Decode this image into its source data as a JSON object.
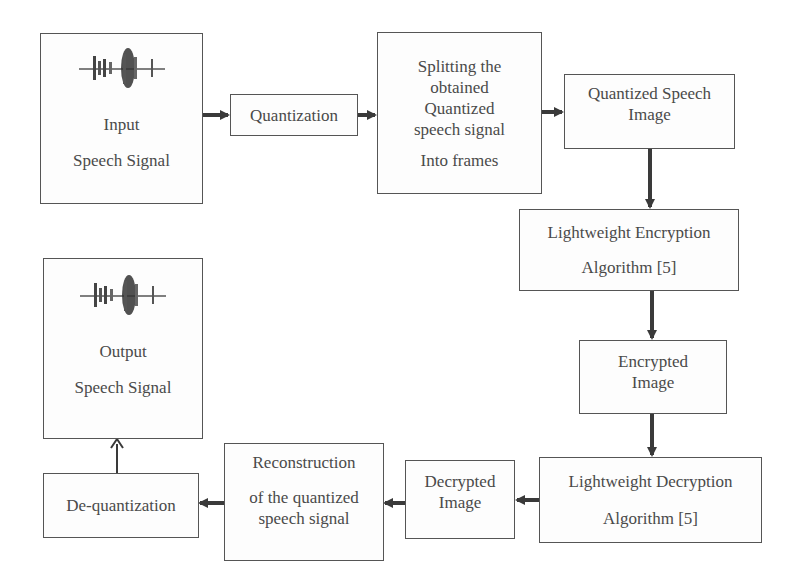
{
  "diagram": {
    "nodes": {
      "input": {
        "lines": [
          "Input",
          "Speech Signal"
        ],
        "icon": "speech-waveform-icon"
      },
      "quantization": {
        "lines": [
          "Quantization"
        ]
      },
      "splitting": {
        "lines": [
          "Splitting the",
          "obtained",
          "Quantized",
          "speech signal",
          "Into frames"
        ]
      },
      "quantized_image": {
        "lines": [
          "Quantized Speech",
          "Image"
        ]
      },
      "encryption": {
        "lines": [
          "Lightweight Encryption",
          "Algorithm [5]"
        ]
      },
      "encrypted_image": {
        "lines": [
          "Encrypted",
          "Image"
        ]
      },
      "decryption": {
        "lines": [
          "Lightweight Decryption",
          "Algorithm [5]"
        ]
      },
      "decrypted_image": {
        "lines": [
          "Decrypted",
          "Image"
        ]
      },
      "reconstruction": {
        "lines": [
          "Reconstruction",
          "of the quantized",
          "speech signal"
        ]
      },
      "dequantization": {
        "lines": [
          "De-quantization"
        ]
      },
      "output": {
        "lines": [
          "Output",
          "Speech Signal"
        ],
        "icon": "speech-waveform-icon"
      }
    },
    "edges": [
      [
        "input",
        "quantization"
      ],
      [
        "quantization",
        "splitting"
      ],
      [
        "splitting",
        "quantized_image"
      ],
      [
        "quantized_image",
        "encryption"
      ],
      [
        "encryption",
        "encrypted_image"
      ],
      [
        "encrypted_image",
        "decryption"
      ],
      [
        "decryption",
        "decrypted_image"
      ],
      [
        "decrypted_image",
        "reconstruction"
      ],
      [
        "reconstruction",
        "dequantization"
      ],
      [
        "dequantization",
        "output"
      ]
    ],
    "colors": {
      "stroke": "#555555",
      "arrow": "#3a3a3a",
      "text": "#4a4a4a"
    }
  }
}
